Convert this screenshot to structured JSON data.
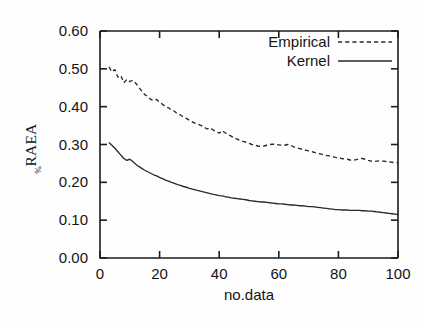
{
  "chart_data": {
    "type": "line",
    "title": "",
    "xlabel": "no.data",
    "ylabel": "RAEA",
    "ylabel_subscript": "%",
    "xlim": [
      0,
      100
    ],
    "ylim": [
      0.0,
      0.6
    ],
    "xticks": [
      0,
      20,
      40,
      60,
      80,
      100
    ],
    "xticklabels": [
      "0",
      "20",
      "40",
      "60",
      "80",
      "100"
    ],
    "yticks": [
      0.0,
      0.1,
      0.2,
      0.3,
      0.4,
      0.5,
      0.6
    ],
    "yticklabels": [
      "0.00",
      "0.10",
      "0.20",
      "0.30",
      "0.40",
      "0.50",
      "0.60"
    ],
    "grid": false,
    "legend_position": "top-right",
    "legend": [
      "Empirical",
      "Kernel"
    ],
    "x": [
      3,
      4,
      5,
      6,
      7,
      8,
      9,
      10,
      11,
      12,
      13,
      14,
      15,
      16,
      17,
      18,
      19,
      20,
      21,
      22,
      23,
      24,
      25,
      26,
      27,
      28,
      29,
      30,
      31,
      32,
      33,
      34,
      35,
      36,
      37,
      38,
      39,
      40,
      41,
      42,
      43,
      44,
      45,
      46,
      47,
      48,
      49,
      50,
      51,
      52,
      53,
      54,
      55,
      56,
      57,
      58,
      59,
      60,
      61,
      62,
      63,
      64,
      65,
      66,
      67,
      68,
      69,
      70,
      71,
      72,
      73,
      74,
      75,
      76,
      77,
      78,
      79,
      80,
      81,
      82,
      83,
      84,
      85,
      86,
      87,
      88,
      89,
      90,
      91,
      92,
      93,
      94,
      95,
      96,
      97,
      98,
      99,
      100
    ],
    "series": [
      {
        "name": "Empirical",
        "style": "dashed",
        "color": "#2a2a2a",
        "values": [
          0.505,
          0.492,
          0.498,
          0.478,
          0.482,
          0.463,
          0.472,
          0.466,
          0.47,
          0.462,
          0.452,
          0.441,
          0.432,
          0.427,
          0.419,
          0.416,
          0.419,
          0.412,
          0.406,
          0.4,
          0.397,
          0.391,
          0.388,
          0.381,
          0.378,
          0.372,
          0.369,
          0.364,
          0.36,
          0.356,
          0.353,
          0.35,
          0.345,
          0.341,
          0.344,
          0.338,
          0.334,
          0.33,
          0.337,
          0.331,
          0.326,
          0.322,
          0.318,
          0.314,
          0.311,
          0.308,
          0.306,
          0.303,
          0.3,
          0.298,
          0.296,
          0.295,
          0.296,
          0.298,
          0.3,
          0.301,
          0.3,
          0.299,
          0.298,
          0.298,
          0.3,
          0.298,
          0.294,
          0.291,
          0.289,
          0.287,
          0.285,
          0.283,
          0.281,
          0.279,
          0.277,
          0.275,
          0.273,
          0.271,
          0.27,
          0.268,
          0.266,
          0.265,
          0.263,
          0.262,
          0.261,
          0.259,
          0.258,
          0.26,
          0.262,
          0.263,
          0.261,
          0.258,
          0.256,
          0.255,
          0.256,
          0.257,
          0.256,
          0.255,
          0.254,
          0.253,
          0.252,
          0.251
        ]
      },
      {
        "name": "Kernel",
        "style": "solid",
        "color": "#2a2a2a",
        "values": [
          0.305,
          0.298,
          0.29,
          0.281,
          0.272,
          0.263,
          0.258,
          0.261,
          0.255,
          0.248,
          0.242,
          0.237,
          0.232,
          0.228,
          0.224,
          0.22,
          0.217,
          0.213,
          0.21,
          0.206,
          0.203,
          0.2,
          0.197,
          0.194,
          0.192,
          0.189,
          0.187,
          0.184,
          0.182,
          0.18,
          0.178,
          0.176,
          0.174,
          0.172,
          0.17,
          0.168,
          0.167,
          0.165,
          0.164,
          0.162,
          0.161,
          0.159,
          0.158,
          0.157,
          0.156,
          0.155,
          0.154,
          0.152,
          0.151,
          0.15,
          0.149,
          0.148,
          0.148,
          0.147,
          0.146,
          0.145,
          0.144,
          0.143,
          0.143,
          0.142,
          0.141,
          0.14,
          0.14,
          0.139,
          0.138,
          0.138,
          0.137,
          0.136,
          0.136,
          0.135,
          0.134,
          0.133,
          0.132,
          0.131,
          0.13,
          0.129,
          0.128,
          0.128,
          0.127,
          0.127,
          0.127,
          0.126,
          0.126,
          0.126,
          0.126,
          0.125,
          0.125,
          0.124,
          0.124,
          0.123,
          0.122,
          0.121,
          0.12,
          0.119,
          0.118,
          0.117,
          0.116,
          0.115
        ]
      }
    ]
  }
}
